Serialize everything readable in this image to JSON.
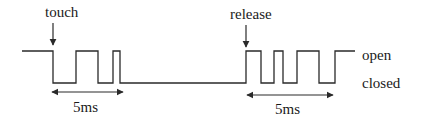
{
  "diagram": {
    "colors": {
      "line": "#2a2a2a",
      "text": "#1a1a1a",
      "background": "#ffffff"
    },
    "events": [
      {
        "label": "touch",
        "x": 53
      },
      {
        "label": "release",
        "x": 246
      }
    ],
    "levels": {
      "open": "open",
      "closed": "closed"
    },
    "durations": [
      {
        "label": "5ms",
        "x1": 52,
        "x2": 123
      },
      {
        "label": "5ms",
        "x1": 247,
        "x2": 333
      }
    ],
    "waveform_points": "22,51 53,51 53,83 76,83 76,51 98,51 98,83 113,83 113,51 120,51 120,83 246,83 246,51 261,51 261,83 274,83 274,51 283,51 283,83 297,83 297,51 319,51 319,83 335,83 335,51 355,51"
  }
}
